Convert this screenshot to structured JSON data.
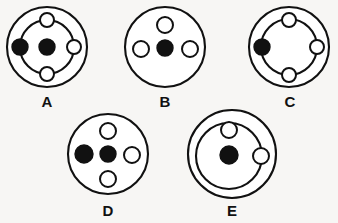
{
  "page": {
    "background_color": "#f7f6f4",
    "ink_color": "#111111",
    "width": 338,
    "height": 223
  },
  "figures": [
    {
      "id": "A",
      "label": "A",
      "label_x": 47,
      "label_y": 107,
      "outer": {
        "cx": 47,
        "cy": 47,
        "r": 40
      },
      "orbit": {
        "cx": 47,
        "cy": 47,
        "r": 27
      },
      "center_dot": {
        "cx": 47,
        "cy": 47,
        "r": 8,
        "fill": "filled"
      },
      "nodes": [
        {
          "position": "top",
          "cx": 47,
          "cy": 20,
          "r": 7,
          "fill": "open"
        },
        {
          "position": "left",
          "cx": 20,
          "cy": 47,
          "r": 8,
          "fill": "filled"
        },
        {
          "position": "right",
          "cx": 74,
          "cy": 47,
          "r": 7,
          "fill": "open"
        },
        {
          "position": "bottom",
          "cx": 47,
          "cy": 74,
          "r": 7,
          "fill": "open"
        }
      ]
    },
    {
      "id": "B",
      "label": "B",
      "label_x": 165,
      "label_y": 107,
      "outer": {
        "cx": 165,
        "cy": 47,
        "r": 40
      },
      "orbit": null,
      "center_dot": {
        "cx": 165,
        "cy": 48,
        "r": 8,
        "fill": "filled"
      },
      "nodes": [
        {
          "position": "top",
          "cx": 165,
          "cy": 25,
          "r": 8,
          "fill": "open"
        },
        {
          "position": "left",
          "cx": 141,
          "cy": 49,
          "r": 8,
          "fill": "open"
        },
        {
          "position": "right",
          "cx": 190,
          "cy": 49,
          "r": 8,
          "fill": "open"
        }
      ]
    },
    {
      "id": "C",
      "label": "C",
      "label_x": 290,
      "label_y": 107,
      "outer": {
        "cx": 289,
        "cy": 47,
        "r": 40
      },
      "orbit": {
        "cx": 289,
        "cy": 47,
        "r": 28
      },
      "center_dot": null,
      "nodes": [
        {
          "position": "top",
          "cx": 289,
          "cy": 20,
          "r": 7,
          "fill": "open"
        },
        {
          "position": "left",
          "cx": 262,
          "cy": 47,
          "r": 8,
          "fill": "filled"
        },
        {
          "position": "right",
          "cx": 317,
          "cy": 47,
          "r": 7,
          "fill": "open"
        },
        {
          "position": "bottom",
          "cx": 289,
          "cy": 75,
          "r": 7,
          "fill": "open"
        }
      ]
    },
    {
      "id": "D",
      "label": "D",
      "label_x": 108,
      "label_y": 216,
      "outer": {
        "cx": 108,
        "cy": 154,
        "r": 40
      },
      "orbit": null,
      "center_dot": {
        "cx": 108,
        "cy": 154,
        "r": 8,
        "fill": "filled"
      },
      "nodes": [
        {
          "position": "top",
          "cx": 108,
          "cy": 131,
          "r": 8,
          "fill": "open"
        },
        {
          "position": "left",
          "cx": 84,
          "cy": 154,
          "r": 9,
          "fill": "filled"
        },
        {
          "position": "right",
          "cx": 132,
          "cy": 155,
          "r": 8,
          "fill": "open"
        },
        {
          "position": "bottom",
          "cx": 108,
          "cy": 179,
          "r": 8,
          "fill": "open"
        }
      ]
    },
    {
      "id": "E",
      "label": "E",
      "label_x": 232,
      "label_y": 216,
      "outer": {
        "cx": 232,
        "cy": 154,
        "r": 44
      },
      "orbit": {
        "cx": 229,
        "cy": 156,
        "r": 33
      },
      "center_dot": {
        "cx": 229,
        "cy": 155,
        "r": 9,
        "fill": "filled"
      },
      "nodes": [
        {
          "position": "top",
          "cx": 229,
          "cy": 130,
          "r": 8,
          "fill": "open"
        },
        {
          "position": "right",
          "cx": 261,
          "cy": 156,
          "r": 8,
          "fill": "open"
        }
      ]
    }
  ]
}
